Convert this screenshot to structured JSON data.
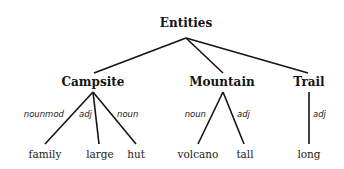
{
  "diagram": {
    "root": "Entities",
    "categories": [
      {
        "label": "Campsite",
        "children": [
          {
            "label": "family",
            "relation": "nounmod"
          },
          {
            "label": "large",
            "relation": "adj"
          },
          {
            "label": "hut",
            "relation": "noun"
          }
        ]
      },
      {
        "label": "Mountain",
        "children": [
          {
            "label": "volcano",
            "relation": "noun"
          },
          {
            "label": "tall",
            "relation": "adj"
          }
        ]
      },
      {
        "label": "Trail",
        "children": [
          {
            "label": "long",
            "relation": "adj"
          }
        ]
      }
    ]
  }
}
